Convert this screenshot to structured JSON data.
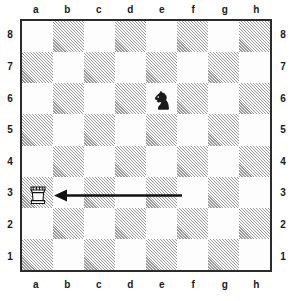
{
  "diagram": {
    "kind": "chess-board-diagram",
    "orientation": "white-bottom",
    "board_size": 8
  },
  "coordinates": {
    "files": [
      "a",
      "b",
      "c",
      "d",
      "e",
      "f",
      "g",
      "h"
    ],
    "ranks": [
      "8",
      "7",
      "6",
      "5",
      "4",
      "3",
      "2",
      "1"
    ],
    "files_shown_top": true,
    "files_shown_bottom": true,
    "ranks_shown_left": true,
    "ranks_shown_right": true
  },
  "colors": {
    "light_square": "#fdfdfd",
    "dark_square_ink": "#9a9a9a",
    "border": "#2b2b2b",
    "piece_outline": "#111111",
    "piece_white_fill": "#ffffff",
    "piece_black_fill": "#1a1a1a",
    "arrow": "#111111",
    "label_text": "#1a1a1a"
  },
  "squares": {
    "dark_color_parity_note": "a1 is a dark square; a8 is a light square",
    "pattern": [
      [
        "light",
        "dark",
        "light",
        "dark",
        "light",
        "dark",
        "light",
        "dark"
      ],
      [
        "dark",
        "light",
        "dark",
        "light",
        "dark",
        "light",
        "dark",
        "light"
      ],
      [
        "light",
        "dark",
        "light",
        "dark",
        "light",
        "dark",
        "light",
        "dark"
      ],
      [
        "dark",
        "light",
        "dark",
        "light",
        "dark",
        "light",
        "dark",
        "light"
      ],
      [
        "light",
        "dark",
        "light",
        "dark",
        "light",
        "dark",
        "light",
        "dark"
      ],
      [
        "dark",
        "light",
        "dark",
        "light",
        "dark",
        "light",
        "dark",
        "light"
      ],
      [
        "light",
        "dark",
        "light",
        "dark",
        "light",
        "dark",
        "light",
        "dark"
      ],
      [
        "dark",
        "light",
        "dark",
        "light",
        "dark",
        "light",
        "dark",
        "light"
      ]
    ]
  },
  "pieces": [
    {
      "id": "black-knight-e6",
      "type": "knight",
      "color": "black",
      "square": "e6",
      "file": "e",
      "rank": "6",
      "file_index": 4,
      "rank_index": 2,
      "glyph": "♞"
    },
    {
      "id": "white-rook-a3",
      "type": "rook",
      "color": "white",
      "square": "a3",
      "file": "a",
      "rank": "3",
      "file_index": 0,
      "rank_index": 5,
      "glyph": "♖"
    }
  ],
  "arrow": {
    "id": "move-arrow-to-a3",
    "from_square": "f3",
    "to_square": "a3",
    "direction": "leftward",
    "head_at": "to_square",
    "tail_x": 160,
    "tail_y": 174.5,
    "tip_x": 32,
    "tip_y": 174.5,
    "stroke_width": 2.4,
    "head_length": 13,
    "head_half_width": 6
  }
}
